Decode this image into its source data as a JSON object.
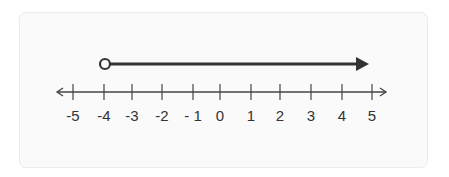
{
  "chart_data": {
    "type": "number_line",
    "title": "",
    "range": [
      -5,
      5
    ],
    "ticks": [
      -5,
      -4,
      -3,
      -2,
      -1,
      0,
      1,
      2,
      3,
      4,
      5
    ],
    "tick_labels": [
      "-5",
      "-4",
      "-3",
      "-2",
      "- 1",
      "0",
      "1",
      "2",
      "3",
      "4",
      "5"
    ],
    "axis_arrows": "both",
    "ray": {
      "start": -4,
      "start_endpoint": "open",
      "direction": "right",
      "inequality": "x > -4"
    }
  },
  "colors": {
    "card_bg": "#fafafa",
    "card_border": "#ececec",
    "axis": "#444444",
    "ray": "#333333",
    "label": "#333333"
  }
}
